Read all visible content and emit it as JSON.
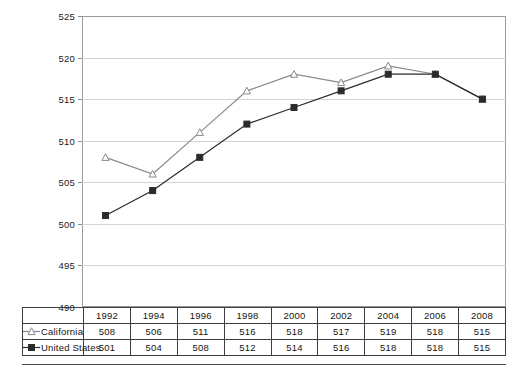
{
  "chart_data": {
    "type": "line",
    "title": "",
    "subtitle": "",
    "xlabel": "",
    "ylabel": "",
    "categories": [
      "1992",
      "1994",
      "1996",
      "1998",
      "2000",
      "2002",
      "2004",
      "2006",
      "2008"
    ],
    "series": [
      {
        "name": "California",
        "values": [
          508,
          506,
          511,
          516,
          518,
          517,
          519,
          518,
          515
        ],
        "color": "#8a8a8a",
        "marker": "triangle-open"
      },
      {
        "name": "United States",
        "values": [
          501,
          504,
          508,
          512,
          514,
          516,
          518,
          518,
          515
        ],
        "color": "#2b2b2b",
        "marker": "square-filled"
      }
    ],
    "ylim": [
      490,
      525
    ],
    "yticks": [
      490,
      495,
      500,
      505,
      510,
      515,
      520,
      525
    ],
    "ytick_labels": [
      "490",
      "495",
      "500",
      "505",
      "510",
      "515",
      "520",
      "525"
    ],
    "grid": true,
    "legend_position": "table-row-headers",
    "annotations": []
  },
  "table": {
    "header_row": [
      "",
      "1992",
      "1994",
      "1996",
      "1998",
      "2000",
      "2002",
      "2004",
      "2006",
      "2008"
    ],
    "rows": [
      {
        "label": "California",
        "marker": "triangle-open",
        "values": [
          "508",
          "506",
          "511",
          "516",
          "518",
          "517",
          "519",
          "518",
          "515"
        ]
      },
      {
        "label": "United States",
        "marker": "square-filled",
        "values": [
          "501",
          "504",
          "508",
          "512",
          "514",
          "516",
          "518",
          "518",
          "515"
        ]
      }
    ]
  },
  "axis": {
    "ytick_labels": [
      "525",
      "520",
      "515",
      "510",
      "505",
      "500",
      "495",
      "490"
    ]
  },
  "colors": {
    "california_line": "#8a8a8a",
    "united_states_line": "#2b2b2b",
    "gridline": "#d4d4d4",
    "frame": "#9a9a9a",
    "table_border": "#3d3d3d"
  }
}
